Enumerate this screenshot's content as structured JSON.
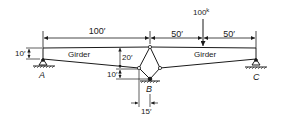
{
  "diagram": {
    "type": "structural-truss-girder",
    "labels": {
      "span_left": "100′",
      "span_mid": "50′",
      "span_right": "50′",
      "load": "100",
      "load_unit": "k",
      "depth_A": "10′",
      "depth_mid": "20′",
      "depth_B": "10′",
      "offset_B": "15′",
      "girder_left": "Girder",
      "girder_right": "Girder",
      "support_A": "A",
      "support_B": "B",
      "support_C": "C"
    },
    "colors": {
      "line": "#1a1a1a",
      "background": "#ffffff"
    }
  }
}
